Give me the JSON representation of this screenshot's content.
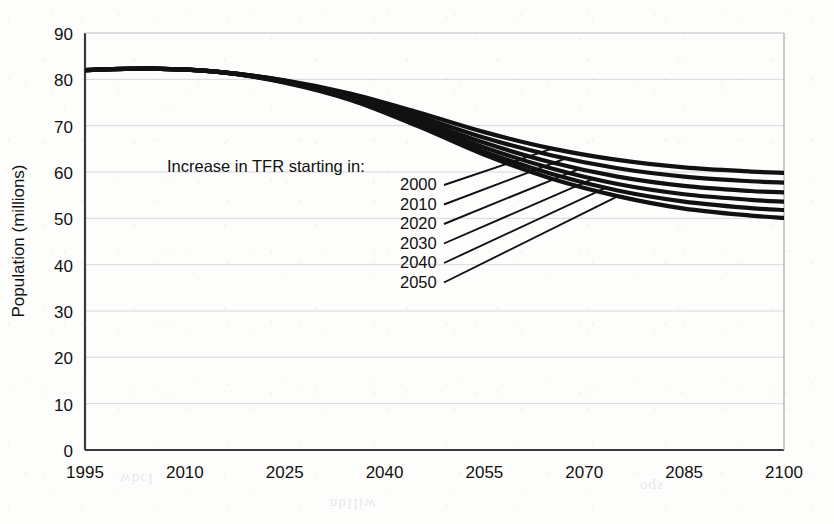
{
  "chart_data": {
    "type": "line",
    "title": "",
    "xlabel": "",
    "ylabel": "Population (millions)",
    "xlim": [
      1995,
      2100
    ],
    "ylim": [
      0,
      90
    ],
    "grid": true,
    "legend_position": "inline-annotation",
    "x_ticks": [
      "1995",
      "2010",
      "2025",
      "2040",
      "2055",
      "2070",
      "2085",
      "2100"
    ],
    "y_ticks": [
      "0",
      "10",
      "20",
      "30",
      "40",
      "50",
      "60",
      "70",
      "80",
      "90"
    ],
    "annotation": "Increase in TFR starting in:",
    "x": [
      1995,
      2005,
      2015,
      2025,
      2035,
      2045,
      2055,
      2065,
      2075,
      2085,
      2095,
      2100
    ],
    "series": [
      {
        "name": "2000",
        "values": [
          82.0,
          82.3,
          81.6,
          79.8,
          76.9,
          72.9,
          68.6,
          65.1,
          62.6,
          61.0,
          60.1,
          59.8
        ]
      },
      {
        "name": "2010",
        "values": [
          82.0,
          82.3,
          81.6,
          79.7,
          76.5,
          72.1,
          67.4,
          63.6,
          60.8,
          59.0,
          58.0,
          57.7
        ]
      },
      {
        "name": "2020",
        "values": [
          82.0,
          82.3,
          81.6,
          79.6,
          76.2,
          71.4,
          66.3,
          62.1,
          59.0,
          57.0,
          55.9,
          55.6
        ]
      },
      {
        "name": "2030",
        "values": [
          82.0,
          82.3,
          81.6,
          79.5,
          75.9,
          70.8,
          65.3,
          60.8,
          57.4,
          55.2,
          54.0,
          53.6
        ]
      },
      {
        "name": "2040",
        "values": [
          82.0,
          82.3,
          81.6,
          79.4,
          75.7,
          70.3,
          64.4,
          59.6,
          56.0,
          53.6,
          52.2,
          51.8
        ]
      },
      {
        "name": "2050",
        "values": [
          82.0,
          82.3,
          81.6,
          79.3,
          75.5,
          69.9,
          63.7,
          58.6,
          54.8,
          52.1,
          50.6,
          50.1
        ]
      }
    ]
  },
  "labels": {
    "y_axis_title": "Population (millions)",
    "annotation_title": "Increase in TFR starting in:",
    "series_labels": [
      "2000",
      "2010",
      "2020",
      "2030",
      "2040",
      "2050"
    ]
  },
  "colors": {
    "line": "#111111",
    "grid": "#d8d8d8",
    "axis": "#3a3a3a",
    "background": "#fdfdfc",
    "text": "#111111"
  },
  "ghost": {
    "a": "wbcI",
    "b": "nbIIiw",
    "c": "oqs"
  }
}
